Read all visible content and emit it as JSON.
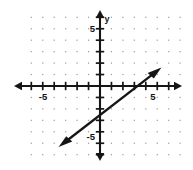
{
  "figure": {
    "background_color": "#ffffff",
    "ink_color": "#151515",
    "grid_dot_color": "#9a9a9a"
  },
  "chart_data": {
    "type": "line",
    "title": "",
    "xlabel": "",
    "ylabel": "y",
    "xlim": [
      -7,
      7
    ],
    "ylim": [
      -6,
      6
    ],
    "grid": "dotted",
    "legend_position": "none",
    "x_axis": {
      "label": "",
      "tick_labels": [
        "-5",
        "5"
      ],
      "tick_values": [
        -5,
        5
      ],
      "ticks_every": 1,
      "arrowheads": "both"
    },
    "y_axis": {
      "label": "y",
      "tick_labels": [
        "5",
        "-5"
      ],
      "tick_values": [
        5,
        -5
      ],
      "ticks_every": 1,
      "arrowheads": "both"
    },
    "series": [
      {
        "name": "line",
        "kind": "line",
        "slope": 1,
        "intercept": -4,
        "equation": "y = x - 4",
        "x": [
          -3.5,
          5.2
        ],
        "values": [
          -7.5,
          1.2
        ],
        "points": [
          [
            0,
            -4
          ],
          [
            4,
            0
          ]
        ],
        "arrowheads": "both",
        "color": "#151515"
      }
    ],
    "annotations": []
  },
  "labels": {
    "y_axis_name": "y",
    "x_neg_five": "-5",
    "x_pos_five": "5",
    "y_pos_five": "5",
    "y_neg_five": "-5"
  }
}
